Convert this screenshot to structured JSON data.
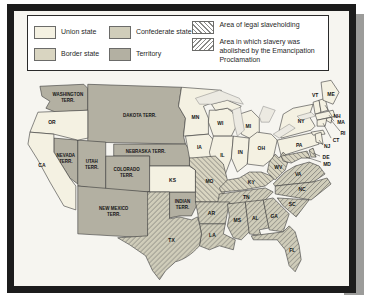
{
  "legend": {
    "items": [
      {
        "label": "Union state",
        "swatch": "union",
        "color": "#f4f1e2"
      },
      {
        "label": "Border state",
        "swatch": "border",
        "color": "#d9d5c1"
      },
      {
        "label": "Confederate state",
        "swatch": "confederate",
        "color": "#d0cdba"
      },
      {
        "label": "Territory",
        "swatch": "territory",
        "color": "#b3b0a2"
      },
      {
        "label": "Area of legal slaveholding",
        "swatch": "hatch-back"
      },
      {
        "label": "Area in which slavery was abolished by the Emancipation Proclamation",
        "swatch": "hatch-fwd"
      }
    ]
  },
  "colors": {
    "frame": "#1c1c1c",
    "page_shadow": "#9c9c9a",
    "background": "#f6f5f0",
    "hatch_line": "#8a8a88",
    "outline": "#3a3a3a"
  },
  "map": {
    "labels": {
      "washington_1": "WASHINGTON",
      "washington_2": "TERR.",
      "dakota": "DAKOTA TERR.",
      "nebraska": "NEBRASKA TERR.",
      "nevada_1": "NEVADA",
      "nevada_2": "TERR.",
      "utah_1": "UTAH",
      "utah_2": "TERR.",
      "colorado_1": "COLORADO",
      "colorado_2": "TERR.",
      "new_mexico_1": "NEW MEXICO",
      "new_mexico_2": "TERR.",
      "indian_1": "INDIAN",
      "indian_2": "TERR.",
      "or": "OR",
      "ca": "CA",
      "ks": "KS",
      "mn": "MN",
      "ia": "IA",
      "mo": "MO",
      "ar": "AR",
      "la": "LA",
      "tx": "TX",
      "wi": "WI",
      "il": "IL",
      "mi": "MI",
      "in": "IN",
      "oh": "OH",
      "ky": "KY",
      "tn": "TN",
      "ms": "MS",
      "al": "AL",
      "ga": "GA",
      "fl": "FL",
      "sc": "SC",
      "nc": "NC",
      "va": "VA",
      "wv": "WV",
      "pa": "PA",
      "ny": "NY",
      "nj": "NJ",
      "de": "DE",
      "md": "MD",
      "ct": "CT",
      "ri": "RI",
      "ma": "MA",
      "nh": "NH",
      "vt": "VT",
      "me": "ME"
    }
  }
}
